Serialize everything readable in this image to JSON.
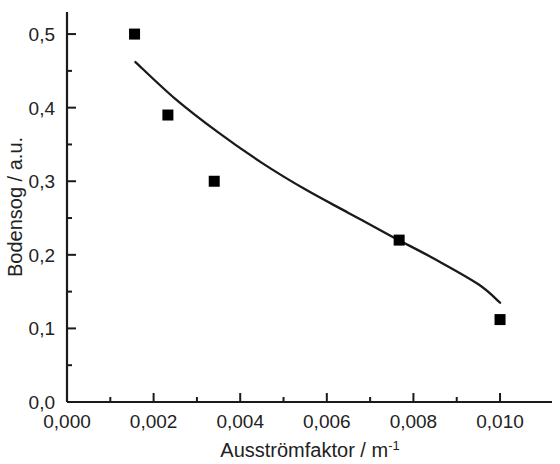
{
  "chart_data": {
    "type": "scatter",
    "title": "",
    "subtitle": "",
    "xlabel": "Ausströmfaktor / m",
    "xlabel_superscript": "-1",
    "xlabel_full": "Ausströmfaktor / m-1",
    "ylabel": "Bodensog / a.u.",
    "xlim": [
      0.0,
      0.0112
    ],
    "ylim": [
      0.0,
      0.53
    ],
    "grid": false,
    "legend": null,
    "legend_position": "none",
    "decimal_separator": ",",
    "x_ticks": [
      0.0,
      0.002,
      0.004,
      0.006,
      0.008,
      0.01
    ],
    "x_tick_labels": [
      "0,000",
      "0,002",
      "0,004",
      "0,006",
      "0,008",
      "0,010"
    ],
    "x_minor_ticks": [
      0.001,
      0.003,
      0.005,
      0.007,
      0.009
    ],
    "y_ticks": [
      0.0,
      0.1,
      0.2,
      0.3,
      0.4,
      0.5
    ],
    "y_tick_labels": [
      "0,0",
      "0,1",
      "0,2",
      "0,3",
      "0,4",
      "0,5"
    ],
    "y_minor_ticks": [
      0.05,
      0.15,
      0.25,
      0.35,
      0.45,
      0.55
    ],
    "marker": "filled-square",
    "marker_color": "#000000",
    "line_color": "#1a1a1a",
    "series": [
      {
        "name": "Messpunkte",
        "type": "scatter",
        "x": [
          0.00156,
          0.00233,
          0.0034,
          0.00767,
          0.01
        ],
        "y": [
          0.5,
          0.39,
          0.3,
          0.22,
          0.112
        ]
      },
      {
        "name": "Fitkurve",
        "type": "line",
        "x": [
          0.00158,
          0.0025,
          0.0035,
          0.0045,
          0.0055,
          0.0065,
          0.0075,
          0.0085,
          0.0095,
          0.01
        ],
        "y": [
          0.462,
          0.412,
          0.366,
          0.325,
          0.289,
          0.257,
          0.225,
          0.194,
          0.16,
          0.135
        ]
      }
    ]
  }
}
